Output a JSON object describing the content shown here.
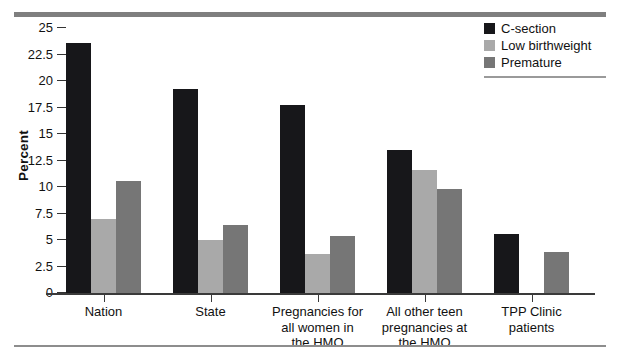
{
  "chart_data": {
    "type": "bar",
    "title": "",
    "subtitle": "",
    "xlabel": "",
    "ylabel": "Percent",
    "ylim": [
      0,
      25
    ],
    "yticks": [
      "0",
      "2.5",
      "5",
      "7.5",
      "10",
      "12.5",
      "15",
      "17.5",
      "20",
      "22.5",
      "25"
    ],
    "grid": false,
    "legend_position": "top-right",
    "categories": [
      "Nation",
      "State",
      "Pregnancies for all women in the HMO",
      "All other teen pregnancies at the HMO",
      "TPP Clinic patients"
    ],
    "category_lines": [
      [
        "Nation"
      ],
      [
        "State"
      ],
      [
        "Pregnancies for",
        "all women in",
        "the HMO"
      ],
      [
        "All other teen",
        "pregnancies at",
        "the HMO"
      ],
      [
        "TPP Clinic",
        "patients"
      ]
    ],
    "series": [
      {
        "name": "C-section",
        "color": "#17171a",
        "values": [
          23.6,
          19.2,
          17.7,
          13.5,
          5.6
        ]
      },
      {
        "name": "Low birthweight",
        "color": "#a9a9a9",
        "values": [
          7.0,
          5.0,
          3.7,
          11.6,
          null
        ]
      },
      {
        "name": "Premature",
        "color": "#767676",
        "values": [
          10.6,
          6.4,
          5.4,
          9.8,
          3.9
        ]
      }
    ]
  },
  "colors": {
    "c_section": "#17171a",
    "low_birthweight": "#a9a9a9",
    "premature": "#767676",
    "rule": "#7f7f7f",
    "axis": "#3a3a3a"
  }
}
